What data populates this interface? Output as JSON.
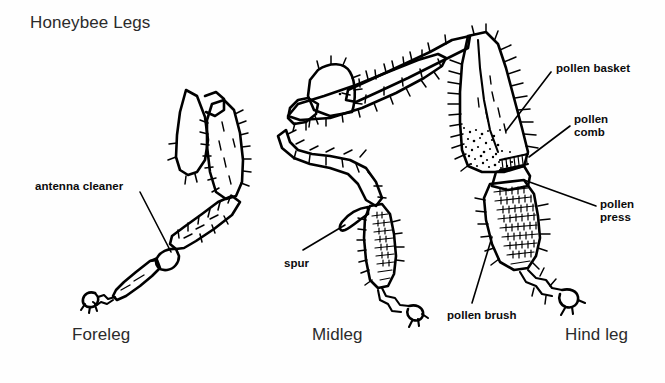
{
  "figure": {
    "title": "Honeybee Legs",
    "background_color": "#fefefe",
    "ink_color": "#000000",
    "width": 665,
    "height": 383
  },
  "leg_names": {
    "foreleg": "Foreleg",
    "midleg": "Midleg",
    "hindleg": "Hind leg"
  },
  "annotations": {
    "antenna_cleaner": "antenna cleaner",
    "spur": "spur",
    "pollen_brush": "pollen brush",
    "pollen_basket": "pollen basket",
    "pollen_comb": "pollen\ncomb",
    "pollen_press": "pollen\npress"
  },
  "diagram_parts": [
    "foreleg-coxa",
    "foreleg-femur",
    "foreleg-tibia",
    "foreleg-antenna-cleaner-notch",
    "foreleg-tarsus",
    "foreleg-claw",
    "midleg-coxa",
    "midleg-trochanter",
    "midleg-femur",
    "midleg-tibia",
    "midleg-spur",
    "midleg-basitarsus",
    "midleg-tarsus",
    "midleg-claw",
    "hindleg-femur",
    "hindleg-tibia",
    "hindleg-pollen-basket",
    "hindleg-pollen-comb",
    "hindleg-pollen-press",
    "hindleg-basitarsus",
    "hindleg-tarsus",
    "hindleg-claw"
  ]
}
